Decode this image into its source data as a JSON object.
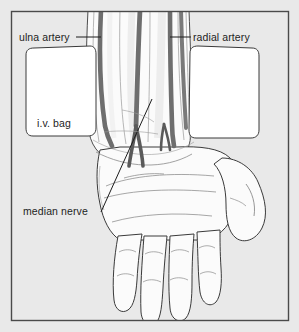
{
  "figure": {
    "kind": "anatomical-diagram",
    "width": 299,
    "height": 332,
    "background_color": "#e9e9e9",
    "frame_color": "#4a4a4a",
    "skin_fill": "#fbfbfb",
    "outline_color": "#3a3a3a",
    "vessel_color": "#6e6e6e",
    "vessel_color_dark": "#5a5a5a",
    "bag_fill": "#ffffff",
    "label_color": "#1d1d1d"
  },
  "labels": [
    {
      "id": "ulna-artery",
      "text": "ulna artery",
      "position": "top-left",
      "leader": "horizontal line pointing right to the dark vessel on the left side of the forearm"
    },
    {
      "id": "radial-artery",
      "text": "radial artery",
      "position": "top-right",
      "leader": "horizontal line pointing left to the dark vessel on the right side of the forearm"
    },
    {
      "id": "iv-bag",
      "text": "i.v. bag",
      "position": "middle-left",
      "leader": "none, text sits inside the white rounded rectangle"
    },
    {
      "id": "median-nerve",
      "text": "median nerve",
      "position": "lower-left",
      "leader": "long diagonal line running up and right to the wrist region"
    }
  ],
  "structures": [
    {
      "id": "forearm",
      "label": "forearm"
    },
    {
      "id": "wrist",
      "label": "wrist crease"
    },
    {
      "id": "palm",
      "label": "palm"
    },
    {
      "id": "thumb",
      "label": "thumb"
    },
    {
      "id": "index-finger",
      "label": "index finger"
    },
    {
      "id": "middle-finger",
      "label": "middle finger"
    },
    {
      "id": "ring-finger",
      "label": "ring finger"
    },
    {
      "id": "little-finger",
      "label": "little finger"
    },
    {
      "id": "iv-bag-left",
      "label": "i.v. bag (left)"
    },
    {
      "id": "iv-bag-right",
      "label": "i.v. bag (right)"
    }
  ]
}
